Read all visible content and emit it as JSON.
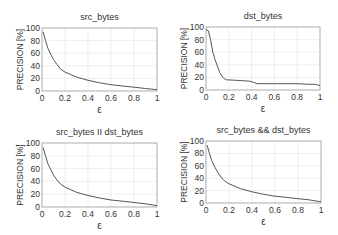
{
  "chart_data": [
    {
      "type": "line",
      "title": "src_bytes",
      "xlabel": "ε",
      "ylabel": "PRECISION [%]",
      "xlim": [
        0,
        1
      ],
      "ylim": [
        0,
        100
      ],
      "xticks": [
        "0",
        "0.2",
        "0.4",
        "0.6",
        "0.8",
        "1"
      ],
      "yticks": [
        "0",
        "20",
        "40",
        "60",
        "80",
        "100"
      ],
      "grid": true,
      "x": [
        0.01,
        0.03,
        0.05,
        0.08,
        0.1,
        0.13,
        0.16,
        0.2,
        0.25,
        0.3,
        0.4,
        0.5,
        0.6,
        0.7,
        0.8,
        0.9,
        1.0
      ],
      "series": [
        {
          "name": "src_bytes",
          "values": [
            94,
            80,
            68,
            57,
            50,
            42,
            35,
            30,
            26,
            22,
            17,
            13,
            10,
            8,
            6,
            4,
            2
          ]
        }
      ],
      "box": {
        "x": 42,
        "y": 28,
        "w": 115,
        "h": 63
      }
    },
    {
      "type": "line",
      "title": "dst_bytes",
      "xlabel": "ε",
      "ylabel": "PRECISION [%]",
      "xlim": [
        0,
        1
      ],
      "ylim": [
        0,
        100
      ],
      "xticks": [
        "0",
        "0.2",
        "0.4",
        "0.6",
        "0.8",
        "1"
      ],
      "yticks": [
        "0",
        "20",
        "40",
        "60",
        "80",
        "100"
      ],
      "grid": true,
      "x": [
        0.0,
        0.02,
        0.04,
        0.06,
        0.08,
        0.1,
        0.12,
        0.14,
        0.16,
        0.18,
        0.2,
        0.3,
        0.38,
        0.42,
        0.45,
        0.5,
        0.6,
        0.7,
        0.8,
        0.9,
        0.96,
        1.0
      ],
      "series": [
        {
          "name": "dst_bytes",
          "values": [
            96,
            94,
            80,
            60,
            48,
            38,
            28,
            22,
            18,
            16,
            16,
            15,
            14,
            12,
            10,
            10,
            10,
            10,
            10,
            9,
            9,
            7
          ]
        }
      ],
      "box": {
        "x": 206,
        "y": 27,
        "w": 114,
        "h": 63
      }
    },
    {
      "type": "line",
      "title": "src_bytes II dst_bytes",
      "xlabel": "ε",
      "ylabel": "PRECISION [%]",
      "xlim": [
        0,
        1
      ],
      "ylim": [
        0,
        100
      ],
      "xticks": [
        "0",
        "0.2",
        "0.4",
        "0.6",
        "0.8",
        "1"
      ],
      "yticks": [
        "0",
        "20",
        "40",
        "60",
        "80",
        "100"
      ],
      "grid": true,
      "x": [
        0.01,
        0.03,
        0.05,
        0.08,
        0.1,
        0.13,
        0.16,
        0.2,
        0.25,
        0.3,
        0.4,
        0.5,
        0.6,
        0.7,
        0.8,
        0.9,
        1.0
      ],
      "series": [
        {
          "name": "src_bytes || dst_bytes",
          "values": [
            93,
            80,
            68,
            57,
            50,
            42,
            36,
            31,
            27,
            23,
            18,
            14,
            11,
            9,
            7,
            5,
            2
          ]
        }
      ],
      "box": {
        "x": 42,
        "y": 143,
        "w": 115,
        "h": 64
      }
    },
    {
      "type": "line",
      "title": "src_bytes && dst_bytes",
      "xlabel": "ε",
      "ylabel": "PRECISION [%]",
      "xlim": [
        0,
        1
      ],
      "ylim": [
        0,
        100
      ],
      "xticks": [
        "0",
        "0.2",
        "0.4",
        "0.6",
        "0.8",
        "1"
      ],
      "yticks": [
        "0",
        "20",
        "40",
        "60",
        "80",
        "100"
      ],
      "grid": true,
      "x": [
        0.01,
        0.03,
        0.05,
        0.08,
        0.1,
        0.13,
        0.16,
        0.2,
        0.25,
        0.3,
        0.4,
        0.5,
        0.6,
        0.7,
        0.8,
        0.9,
        1.0
      ],
      "series": [
        {
          "name": "src_bytes && dst_bytes",
          "values": [
            93,
            80,
            68,
            57,
            50,
            42,
            36,
            31,
            27,
            23,
            18,
            14,
            11,
            9,
            7,
            5,
            2
          ]
        }
      ],
      "box": {
        "x": 206,
        "y": 141,
        "w": 115,
        "h": 62
      }
    }
  ],
  "style": {
    "line_color": "#555555",
    "grid_color": "#e2e2e2",
    "axis_color": "#999999",
    "text_color": "#333333"
  }
}
